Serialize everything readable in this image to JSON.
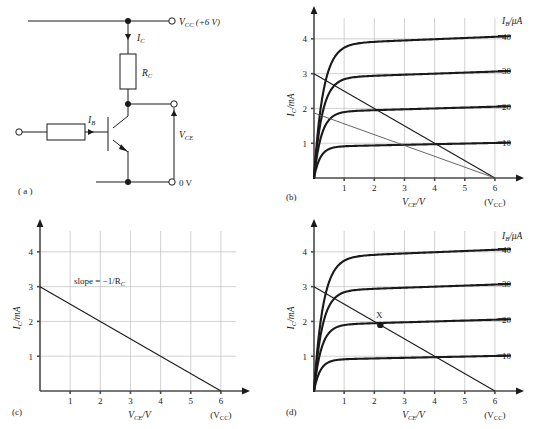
{
  "figure": {
    "panels": [
      {
        "key": "a",
        "label": "( a )"
      },
      {
        "key": "b",
        "label": "(b)"
      },
      {
        "key": "c",
        "label": "(c)"
      },
      {
        "key": "d",
        "label": "(d)"
      }
    ]
  },
  "circuit": {
    "supply_label": "V",
    "supply_sub": "CC",
    "supply_value": " (+6 V)",
    "ground_label": "0 V",
    "collector_current": "I",
    "collector_current_sub": "C",
    "base_current": "I",
    "base_current_sub": "B",
    "resistor_label": "R",
    "resistor_label_sub": "C",
    "output_voltage": "V",
    "output_voltage_sub": "CE"
  },
  "chart_data": [
    {
      "panel": "b",
      "type": "line",
      "title": "",
      "xlabel": "V_CE/V",
      "xlabel_main": "V",
      "xlabel_sub": "CE",
      "xlabel_unit": "/V",
      "ylabel_main": "I",
      "ylabel_sub": "C",
      "ylabel_unit": "/mA",
      "legend_title_main": "I",
      "legend_title_sub": "B",
      "legend_title_unit": "/μA",
      "legend_position": "right",
      "grid": true,
      "xlim": [
        0,
        6.5
      ],
      "ylim": [
        0,
        4.6
      ],
      "xticks": [
        1,
        2,
        3,
        4,
        5,
        6
      ],
      "yticks": [
        1,
        2,
        3,
        4
      ],
      "vcc_annotation": "(V",
      "vcc_annotation_sub": "CC",
      "vcc_annotation_end": ")",
      "series": [
        {
          "name": "40",
          "saturation": 3.85,
          "knee": 0.3,
          "slope": 0.035
        },
        {
          "name": "30",
          "saturation": 2.88,
          "knee": 0.27,
          "slope": 0.03
        },
        {
          "name": "20",
          "saturation": 1.9,
          "knee": 0.24,
          "slope": 0.025
        },
        {
          "name": "10",
          "saturation": 0.9,
          "knee": 0.2,
          "slope": 0.018
        }
      ],
      "load_lines": [
        {
          "name": "load-line-primary",
          "x0": 0,
          "y0": 3.0,
          "x1": 6.0,
          "y1": 0
        },
        {
          "name": "load-line-secondary",
          "x0": 0,
          "y0": 1.87,
          "x1": 6.0,
          "y1": 0
        }
      ],
      "operating_point": null
    },
    {
      "panel": "c",
      "type": "line",
      "title": "",
      "xlabel_main": "V",
      "xlabel_sub": "CE",
      "xlabel_unit": "/V",
      "ylabel_main": "I",
      "ylabel_sub": "C",
      "ylabel_unit": "/mA",
      "grid": true,
      "xlim": [
        0,
        6.5
      ],
      "ylim": [
        0,
        4.6
      ],
      "xticks": [
        1,
        2,
        3,
        4,
        5,
        6
      ],
      "yticks": [
        1,
        2,
        3,
        4
      ],
      "vcc_annotation": "(V",
      "vcc_annotation_sub": "CC",
      "vcc_annotation_end": ")",
      "annotation_text": "slope = −1/R",
      "annotation_sub": "C",
      "load_lines": [
        {
          "name": "load-line",
          "x0": 0,
          "y0": 3.0,
          "x1": 6.0,
          "y1": 0
        }
      ]
    },
    {
      "panel": "d",
      "type": "line",
      "title": "",
      "xlabel_main": "V",
      "xlabel_sub": "CE",
      "xlabel_unit": "/V",
      "ylabel_main": "I",
      "ylabel_sub": "C",
      "ylabel_unit": "/mA",
      "legend_title_main": "I",
      "legend_title_sub": "B",
      "legend_title_unit": "/μA",
      "legend_position": "right",
      "grid": true,
      "xlim": [
        0,
        6.5
      ],
      "ylim": [
        0,
        4.6
      ],
      "xticks": [
        1,
        2,
        3,
        4,
        5,
        6
      ],
      "yticks": [
        1,
        2,
        3,
        4
      ],
      "vcc_annotation": "(V",
      "vcc_annotation_sub": "CC",
      "vcc_annotation_end": ")",
      "series": [
        {
          "name": "40",
          "saturation": 3.85,
          "knee": 0.3,
          "slope": 0.035
        },
        {
          "name": "30",
          "saturation": 2.88,
          "knee": 0.27,
          "slope": 0.03
        },
        {
          "name": "20",
          "saturation": 1.9,
          "knee": 0.24,
          "slope": 0.025
        },
        {
          "name": "10",
          "saturation": 0.9,
          "knee": 0.2,
          "slope": 0.018
        }
      ],
      "load_lines": [
        {
          "name": "load-line",
          "x0": 0,
          "y0": 3.0,
          "x1": 6.0,
          "y1": 0
        }
      ],
      "operating_point": {
        "label": "X",
        "x": 2.2,
        "y": 1.9
      }
    }
  ],
  "colors": {
    "ink": "#1a1a1a",
    "grid": "#bdbdbd",
    "axis": "#4a4a4a"
  }
}
